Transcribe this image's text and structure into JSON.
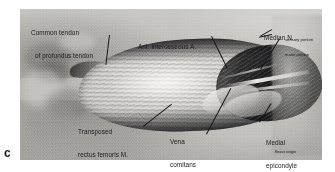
{
  "figure": {
    "panel_letter": "c",
    "caption_alt": "Grayscale intraoperative photograph of forearm showing transposed rectus femoris muscle flap",
    "colors": {
      "page_background": "#ffffff",
      "photo_background": "#b9b8b5",
      "ink": "#1b1b1d",
      "leader_line": "#18181a"
    }
  },
  "labels": [
    {
      "id": "common-tendon",
      "lines": [
        "Common tendon",
        "of profundus tendon"
      ],
      "sub": ""
    },
    {
      "id": "ant-interosseous-artery",
      "lines": [
        "Ant. interosseous A."
      ],
      "sub": ""
    },
    {
      "id": "median-nerve",
      "lines": [
        "Median N."
      ],
      "sub": [
        "sensory portion",
        "motor portion"
      ]
    },
    {
      "id": "transposed-rectus-femoris",
      "lines": [
        "Transposed",
        "rectus femoris M."
      ],
      "sub": ""
    },
    {
      "id": "vena-comitans",
      "lines": [
        "Vena",
        "comitans"
      ],
      "sub": ""
    },
    {
      "id": "medial-epicondyle",
      "lines": [
        "Medial",
        "epicondyle"
      ],
      "sub": [
        "flexor origin"
      ]
    }
  ]
}
